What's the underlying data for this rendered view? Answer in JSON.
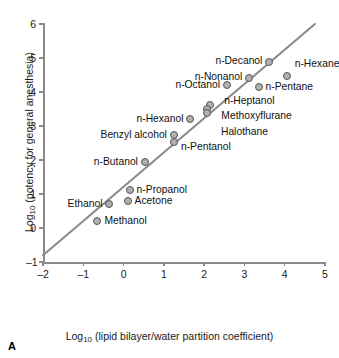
{
  "panel_letter": "A",
  "chart_data": {
    "type": "scatter",
    "title": "",
    "xlabel": "Log10 (lipid bilayer/water partition coefficient)",
    "ylabel": "Log10 (potency for general anesthesia)",
    "xlim": [
      -2,
      5
    ],
    "ylim": [
      -1,
      6
    ],
    "xticks": [
      -2,
      -1,
      0,
      1,
      2,
      3,
      4,
      5
    ],
    "yticks": [
      -1,
      0,
      1,
      2,
      3,
      4,
      5,
      6
    ],
    "xticklabels": [
      "–2",
      "–1",
      "0",
      "1",
      "2",
      "3",
      "4",
      "5"
    ],
    "yticklabels": [
      "–1",
      "0",
      "1",
      "2",
      "3",
      "4",
      "5",
      "6"
    ],
    "grid": false,
    "legend": null,
    "marker_color": "#b0b0b0",
    "marker_edge_color": "#555555",
    "line_color": "#8a8a8a",
    "axis_color": "#8a8a8a",
    "trend_line": {
      "x": [
        -2,
        4.75
      ],
      "y": [
        -0.8,
        6.0
      ],
      "slope": 1.0,
      "intercept": 1.2
    },
    "points": [
      {
        "name": "Methanol",
        "x": -0.65,
        "y": 0.2,
        "label": "Methanol",
        "label_pos": "right"
      },
      {
        "name": "Ethanol",
        "x": -0.35,
        "y": 0.7,
        "label": "Ethanol",
        "label_pos": "left"
      },
      {
        "name": "Acetone",
        "x": 0.1,
        "y": 0.8,
        "label": "Acetone",
        "label_pos": "right"
      },
      {
        "name": "n-Propanol",
        "x": 0.15,
        "y": 1.12,
        "label": "n-Propanol",
        "label_pos": "right"
      },
      {
        "name": "n-Butanol",
        "x": 0.53,
        "y": 1.95,
        "label": "n-Butanol",
        "label_pos": "left"
      },
      {
        "name": "Benzyl alcohol",
        "x": 1.25,
        "y": 2.74,
        "label": "Benzyl alcohol",
        "label_pos": "left"
      },
      {
        "name": "n-Pentanol",
        "x": 1.25,
        "y": 2.52,
        "label": "n-Pentanol",
        "label_pos": "right"
      },
      {
        "name": "n-Hexanol",
        "x": 1.66,
        "y": 3.22,
        "label": "n-Hexanol",
        "label_pos": "left"
      },
      {
        "name": "n-Heptanol",
        "x": 2.15,
        "y": 3.62,
        "label": "n-Heptanol",
        "label_pos": "far-right"
      },
      {
        "name": "Methoxyflurane",
        "x": 2.08,
        "y": 3.5,
        "label": "Methoxyflurane",
        "label_pos": "far-right"
      },
      {
        "name": "Halothane",
        "x": 2.07,
        "y": 3.38,
        "label": "Halothane",
        "label_pos": "far-right"
      },
      {
        "name": "n-Octanol",
        "x": 2.57,
        "y": 4.2,
        "label": "n-Octanol",
        "label_pos": "left"
      },
      {
        "name": "n-Nonanol",
        "x": 3.12,
        "y": 4.42,
        "label": "n-Nonanol",
        "label_pos": "left"
      },
      {
        "name": "n-Pentane",
        "x": 3.35,
        "y": 4.15,
        "label": "n-Pentane",
        "label_pos": "right"
      },
      {
        "name": "n-Decanol",
        "x": 3.62,
        "y": 4.88,
        "label": "n-Decanol",
        "label_pos": "left"
      },
      {
        "name": "n-Hexane",
        "x": 4.05,
        "y": 4.47,
        "label": "n-Hexane",
        "label_pos": "above-right"
      }
    ]
  },
  "axis_titles": {
    "x_prefix": "Log",
    "x_sub": "10",
    "x_rest": " (lipid bilayer/water partition coefficient)",
    "y_prefix": "Log",
    "y_sub": "10",
    "y_rest": " (potency for general anesthesia)"
  }
}
